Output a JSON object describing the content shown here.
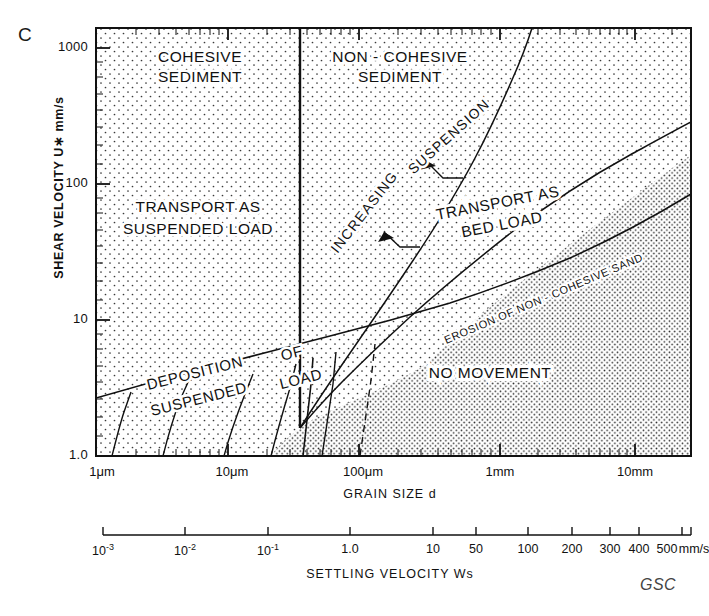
{
  "figure": {
    "panel_letter": "C",
    "credit": "GSC"
  },
  "axes": {
    "y": {
      "title": "SHEAR  VELOCITY  U∗  mm/s",
      "ticks": [
        "1000",
        "100",
        "10",
        "1.0"
      ],
      "values": [
        1000,
        100,
        10,
        1.0
      ],
      "scale": "log",
      "range": [
        1.0,
        2000
      ]
    },
    "x": {
      "title": "GRAIN SIZE d",
      "ticks": [
        "1μm",
        "10μm",
        "100μm",
        "1mm",
        "10mm"
      ],
      "values": [
        1,
        10,
        100,
        1000,
        10000
      ],
      "unit": "μm",
      "scale": "log",
      "range": [
        1,
        25000
      ]
    },
    "settling_velocity": {
      "title": "SETTLING  VELOCITY  Ws",
      "unit_label": "mm/s",
      "ticks": [
        "10⁻³",
        "10⁻²",
        "10⁻¹",
        "1.0",
        "10",
        "50",
        "100",
        "200",
        "300",
        "400",
        "500"
      ],
      "tick_html": [
        "10<sup>-3</sup>",
        "10<sup>-2</sup>",
        "10<sup>-1</sup>",
        "1.0",
        "10",
        "50",
        "100",
        "200",
        "300",
        "400",
        "500"
      ],
      "tick_x": [
        103,
        185,
        268,
        350,
        433,
        476,
        528,
        572,
        610,
        639,
        682
      ]
    }
  },
  "regions": [
    {
      "id": "cohesive-sediment",
      "label": "COHESIVE\nSEDIMENT",
      "line1": "COHESIVE",
      "line2": "SEDIMENT",
      "x": 200,
      "y": 60
    },
    {
      "id": "non-cohesive-sediment",
      "label": "NON-COHESIVE\nSEDIMENT",
      "line1": "NON - COHESIVE",
      "line2": "SEDIMENT",
      "x": 398,
      "y": 60
    },
    {
      "id": "transport-as-suspended-load",
      "line1": "TRANSPORT  AS",
      "line2": "SUSPENDED  LOAD",
      "x": 198,
      "y": 212
    },
    {
      "id": "transport-as-bed-load",
      "line1": "TRANSPORT    AS",
      "line2": "BED    LOAD",
      "x": 490,
      "y": 212
    },
    {
      "id": "no-movement",
      "line1": "NO      MOVEMENT",
      "x": 490,
      "y": 373
    }
  ],
  "curve_labels": [
    {
      "id": "increasing",
      "text": "INCREASING",
      "x": 368,
      "y": 205,
      "rotation": -52
    },
    {
      "id": "suspension",
      "text": "SUSPENSION",
      "x": 455,
      "y": 135,
      "rotation": -40
    },
    {
      "id": "deposition",
      "text": "DEPOSITION",
      "x": 192,
      "y": 380,
      "rotation": -15
    },
    {
      "id": "suspended",
      "text": "SUSPENDED",
      "x": 196,
      "y": 404,
      "rotation": -15
    },
    {
      "id": "of",
      "text": "OF",
      "x": 290,
      "y": 358,
      "rotation": -15
    },
    {
      "id": "load",
      "text": "LOAD",
      "x": 299,
      "y": 383,
      "rotation": -15
    },
    {
      "id": "erosion-of-non-cohesive-sand",
      "text": "EROSION  OF  NON - COHESIVE  SAND",
      "x": 540,
      "y": 305,
      "rotation": -22
    }
  ],
  "chart_data": {
    "type": "line",
    "xlabel": "GRAIN SIZE d",
    "ylabel": "SHEAR  VELOCITY  U* mm/s",
    "xscale": "log",
    "yscale": "log",
    "xlim": [
      1,
      25000
    ],
    "ylim": [
      1.0,
      2000
    ],
    "xunit": "micrometres",
    "yunit": "mm/s",
    "grid": false,
    "legend": "none",
    "series": [
      {
        "name": "critical erosion threshold",
        "comment": "lower boundary separating NO MOVEMENT from transport fields; d in um, u* in mm/s",
        "points": [
          [
            1,
            2.6
          ],
          [
            3,
            3.4
          ],
          [
            10,
            4.6
          ],
          [
            30,
            6.0
          ],
          [
            100,
            8.4
          ],
          [
            200,
            10.5
          ],
          [
            400,
            14
          ],
          [
            1000,
            22
          ],
          [
            3000,
            42
          ],
          [
            10000,
            95
          ],
          [
            25000,
            190
          ]
        ]
      },
      {
        "name": "bed load / suspension boundary (lower)",
        "comment": "boundary between TRANSPORT AS BED LOAD and TRANSPORT AS SUSPENDED LOAD",
        "points": [
          [
            120,
            9.0
          ],
          [
            200,
            13
          ],
          [
            400,
            26
          ],
          [
            700,
            45
          ],
          [
            1500,
            95
          ],
          [
            4000,
            220
          ],
          [
            10000,
            440
          ],
          [
            20000,
            700
          ]
        ]
      },
      {
        "name": "full suspension boundary (upper)",
        "comment": "boundary above which all sediment is carried in suspension",
        "points": [
          [
            55,
            8.0
          ],
          [
            100,
            14
          ],
          [
            200,
            30
          ],
          [
            400,
            70
          ],
          [
            800,
            170
          ],
          [
            1500,
            400
          ],
          [
            2600,
            900
          ],
          [
            3400,
            1700
          ]
        ]
      },
      {
        "name": "cohesive / non-cohesive divide",
        "comment": "vertical line at approximately 65 micrometres",
        "points": [
          [
            65,
            8.0
          ],
          [
            65,
            2000
          ]
        ]
      },
      {
        "name": "deposition contour 1",
        "points": [
          [
            1.3,
            1.0
          ],
          [
            2.2,
            3.2
          ]
        ]
      },
      {
        "name": "deposition contour 2",
        "points": [
          [
            3.3,
            1.0
          ],
          [
            5.2,
            4.2
          ]
        ]
      },
      {
        "name": "deposition contour 3",
        "points": [
          [
            10,
            1.0
          ],
          [
            15,
            5.2
          ]
        ]
      },
      {
        "name": "deposition contour 4",
        "points": [
          [
            30,
            1.0
          ],
          [
            42,
            6.6
          ]
        ]
      },
      {
        "name": "deposition contour 5",
        "points": [
          [
            62,
            1.0
          ],
          [
            70,
            8.1
          ]
        ]
      },
      {
        "name": "deposition contour 6",
        "points": [
          [
            85,
            1.0
          ],
          [
            95,
            8.5
          ]
        ]
      },
      {
        "name": "deposition contour 7 (dashed)",
        "style": "dashed",
        "points": [
          [
            160,
            1.0
          ],
          [
            185,
            9.9
          ]
        ]
      }
    ],
    "annotations": [
      {
        "text": "COHESIVE SEDIMENT",
        "x": 7,
        "y": 800
      },
      {
        "text": "NON-COHESIVE SEDIMENT",
        "x": 500,
        "y": 800
      },
      {
        "text": "TRANSPORT AS SUSPENDED LOAD",
        "x": 7,
        "y": 60
      },
      {
        "text": "TRANSPORT AS BED LOAD",
        "x": 1500,
        "y": 60
      },
      {
        "text": "NO MOVEMENT",
        "x": 1500,
        "y": 4
      },
      {
        "text": "INCREASING",
        "x": 300,
        "y": 55
      },
      {
        "text": "SUSPENSION",
        "x": 700,
        "y": 200
      },
      {
        "text": "DEPOSITION OF SUSPENDED LOAD",
        "x": 10,
        "y": 2.5
      },
      {
        "text": "EROSION OF NON - COHESIVE SAND",
        "x": 3000,
        "y": 40
      }
    ],
    "secondary_axis": {
      "name": "SETTLING VELOCITY Ws",
      "unit": "mm/s",
      "ticks": [
        0.001,
        0.01,
        0.1,
        1.0,
        10,
        50,
        100,
        200,
        300,
        400,
        500
      ]
    }
  }
}
